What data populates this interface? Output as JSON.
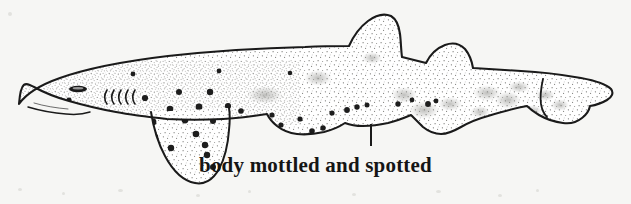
{
  "figure": {
    "caption": "body mottled and spotted",
    "background_color": "#f6f6f4",
    "ink_color": "#1a1a1a",
    "caption_color": "#151515",
    "stipple_color": "#5a5a58",
    "spot_color": "#1d1d1d",
    "leader_line": {
      "x": 371,
      "y_top": 124,
      "y_bottom": 146,
      "width": 2
    },
    "caption_position": {
      "x": 250,
      "y": 152,
      "font_size": 21,
      "font_weight": 700
    }
  },
  "anatomy": {
    "body_outline": "M 19 104 C 30 93 46 84 66 77 C 92 68 128 61 168 56 C 212 51 258 48 300 47 C 322 46 338 46 348 46 C 352 38 358 28 366 22 C 374 16 382 14 389 16 C 395 18 398 24 399 32 C 400 40 400 48 401 56 C 409 58 418 60 426 62 C 430 55 437 48 445 45 C 452 42 459 43 464 48 C 469 53 471 60 472 67 C 486 68 502 69 518 70 C 540 71 562 73 580 76 C 596 79 606 83 610 88 C 613 92 612 96 608 99 C 604 102 598 104 592 106 C 591 110 589 114 585 117 C 580 121 574 123 567 123 C 558 123 549 120 542 116 C 536 113 531 109 528 106 C 516 108 502 111 489 115 C 478 118 469 122 462 126 C 455 130 449 133 443 134 C 436 135 430 133 425 129 C 420 125 416 120 412 116 C 405 119 397 122 389 124 C 380 126 372 127 364 127 C 357 127 351 126 346 124 C 340 128 333 131 325 133 C 316 135 307 136 298 135 C 290 134 283 131 278 127 C 273 123 270 119 268 115 C 255 117 240 118 224 119 C 205 120 186 120 168 119 C 150 118 133 116 117 113 C 100 110 84 106 70 102 C 56 98 44 93 35 88 C 27 84 22 80 19 104 Z",
    "pectoral_fin": "M 152 113 C 154 124 158 140 166 155 C 174 170 184 180 194 182 C 203 184 212 179 218 169 C 224 159 227 145 228 131 C 229 122 229 114 228 108",
    "pelvic_fin": "M 272 116 C 277 124 284 131 292 134 C 300 137 309 136 316 131 C 321 127 324 122 326 117",
    "first_dorsal_fin": "M 348 46 C 352 38 358 28 366 22 C 374 16 382 14 389 16 C 395 18 398 24 399 32 C 400 40 400 48 401 56",
    "second_dorsal_fin": "M 426 62 C 430 55 437 48 445 45 C 452 42 459 43 464 48 C 469 53 471 60 472 67",
    "caudal_fin": "M 528 106 C 536 109 544 113 552 117 C 560 120 568 122 575 121 C 582 120 587 117 590 112 C 592 108 592 104 591 100",
    "mouth_line": "M 28 107 C 38 110 52 113 66 114 C 76 115 84 114 90 112",
    "eye": {
      "cx": 78,
      "cy": 89,
      "rx": 9,
      "ry": 3.2
    },
    "gill_slit_count": 5,
    "gill_slits": [
      {
        "x": 106,
        "y_top": 89,
        "y_bottom": 104
      },
      {
        "x": 113,
        "y_top": 89,
        "y_bottom": 104
      },
      {
        "x": 120,
        "y_top": 89,
        "y_bottom": 104
      },
      {
        "x": 127,
        "y_top": 89,
        "y_bottom": 104
      },
      {
        "x": 134,
        "y_top": 89,
        "y_bottom": 104
      }
    ]
  },
  "markings": {
    "dark_spots": [
      {
        "cx": 69,
        "cy": 100,
        "r": 2.6
      },
      {
        "cx": 96,
        "cy": 113,
        "r": 3.0
      },
      {
        "cx": 133,
        "cy": 74,
        "r": 2.4
      },
      {
        "cx": 145,
        "cy": 98,
        "r": 3.1
      },
      {
        "cx": 153,
        "cy": 122,
        "r": 3.4
      },
      {
        "cx": 155,
        "cy": 137,
        "r": 3.2
      },
      {
        "cx": 170,
        "cy": 109,
        "r": 3.3
      },
      {
        "cx": 179,
        "cy": 92,
        "r": 3.0
      },
      {
        "cx": 185,
        "cy": 120,
        "r": 3.4
      },
      {
        "cx": 196,
        "cy": 134,
        "r": 3.3
      },
      {
        "cx": 199,
        "cy": 107,
        "r": 3.4
      },
      {
        "cx": 205,
        "cy": 145,
        "r": 3.2
      },
      {
        "cx": 210,
        "cy": 92,
        "r": 3.2
      },
      {
        "cx": 213,
        "cy": 121,
        "r": 3.0
      },
      {
        "cx": 219,
        "cy": 71,
        "r": 2.4
      },
      {
        "cx": 228,
        "cy": 106,
        "r": 3.1
      },
      {
        "cx": 235,
        "cy": 126,
        "r": 3.0
      },
      {
        "cx": 241,
        "cy": 111,
        "r": 2.8
      },
      {
        "cx": 249,
        "cy": 130,
        "r": 3.0
      },
      {
        "cx": 256,
        "cy": 118,
        "r": 2.9
      },
      {
        "cx": 263,
        "cy": 133,
        "r": 2.7
      },
      {
        "cx": 272,
        "cy": 115,
        "r": 2.6
      },
      {
        "cx": 281,
        "cy": 125,
        "r": 2.6
      },
      {
        "cx": 290,
        "cy": 73,
        "r": 2.3
      },
      {
        "cx": 300,
        "cy": 119,
        "r": 2.6
      },
      {
        "cx": 312,
        "cy": 131,
        "r": 2.8
      },
      {
        "cx": 323,
        "cy": 128,
        "r": 2.7
      },
      {
        "cx": 332,
        "cy": 113,
        "r": 2.6
      },
      {
        "cx": 347,
        "cy": 110,
        "r": 2.9
      },
      {
        "cx": 357,
        "cy": 107,
        "r": 2.7
      },
      {
        "cx": 367,
        "cy": 105,
        "r": 2.5
      },
      {
        "cx": 398,
        "cy": 104,
        "r": 2.7
      },
      {
        "cx": 412,
        "cy": 100,
        "r": 2.4
      },
      {
        "cx": 428,
        "cy": 104,
        "r": 2.9
      },
      {
        "cx": 436,
        "cy": 101,
        "r": 2.4
      },
      {
        "cx": 171,
        "cy": 148,
        "r": 3.2
      },
      {
        "cx": 207,
        "cy": 155,
        "r": 3.2
      },
      {
        "cx": 166,
        "cy": 163,
        "r": 3.0
      },
      {
        "cx": 213,
        "cy": 167,
        "r": 3.0
      }
    ],
    "mottled_patches": [
      {
        "cx": 265,
        "cy": 95,
        "rx": 18,
        "ry": 9
      },
      {
        "cx": 318,
        "cy": 78,
        "rx": 14,
        "ry": 8
      },
      {
        "cx": 372,
        "cy": 58,
        "rx": 10,
        "ry": 6
      },
      {
        "cx": 404,
        "cy": 95,
        "rx": 13,
        "ry": 8
      },
      {
        "cx": 424,
        "cy": 110,
        "rx": 15,
        "ry": 9
      },
      {
        "cx": 450,
        "cy": 104,
        "rx": 12,
        "ry": 7
      },
      {
        "cx": 487,
        "cy": 93,
        "rx": 14,
        "ry": 8
      },
      {
        "cx": 508,
        "cy": 100,
        "rx": 13,
        "ry": 9
      },
      {
        "cx": 519,
        "cy": 87,
        "rx": 11,
        "ry": 6
      },
      {
        "cx": 545,
        "cy": 95,
        "rx": 10,
        "ry": 6
      },
      {
        "cx": 533,
        "cy": 111,
        "rx": 9,
        "ry": 6
      }
    ],
    "spot_count": 39,
    "description": "dark rounded spots scattered over a stippled body with diffuse mottled grey patches"
  }
}
